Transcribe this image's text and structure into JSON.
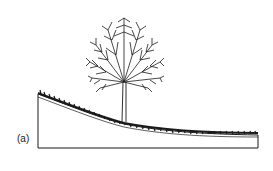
{
  "figure": {
    "panel_label": "(a)",
    "colors": {
      "line": "#1a1a1a",
      "background": "#ffffff"
    }
  }
}
